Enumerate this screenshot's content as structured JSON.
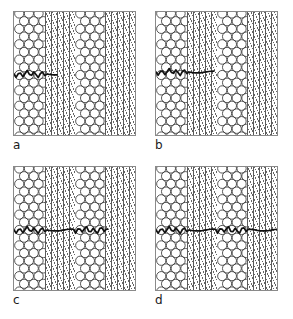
{
  "figure": {
    "background_color": "#ffffff",
    "frame_color": "#8a8a8a",
    "crack_color": "#111111",
    "hatch_color": "#4a4a4a",
    "circle_color": "#3a3a3a",
    "width": 293,
    "height": 319
  },
  "panels": [
    {
      "id": "a",
      "label": "a",
      "position": "top-left",
      "crack_length_fraction": 0.35,
      "crack_start_x": 0,
      "crack_end_x": 43,
      "crack_y": 62,
      "description": "Crack initiated within first fibre bundle, short wavy segment"
    },
    {
      "id": "b",
      "label": "b",
      "position": "top-right",
      "crack_length_fraction": 0.47,
      "crack_start_x": 0,
      "crack_end_x": 58,
      "crack_y": 60,
      "description": "Crack extends through first fibre bundle into matrix band"
    },
    {
      "id": "c",
      "label": "c",
      "position": "bottom-left",
      "crack_length_fraction": 0.76,
      "crack_start_x": 0,
      "crack_end_x": 94,
      "crack_y": 63,
      "description": "Crack spans first bundle, matrix band and second fibre bundle"
    },
    {
      "id": "d",
      "label": "d",
      "position": "bottom-right",
      "crack_length_fraction": 1.0,
      "crack_start_x": 0,
      "crack_end_x": 123,
      "crack_y": 63,
      "description": "Crack propagates across the full specimen width"
    }
  ],
  "bands": {
    "sequence": [
      "circles",
      "hatch",
      "circles",
      "hatch"
    ],
    "circle_band_label": "fibre bundle",
    "hatch_band_label": "matrix region",
    "circle_band_width": 31,
    "hatch_band_width": 30,
    "circle_rows": 16,
    "circle_columns": 3
  }
}
